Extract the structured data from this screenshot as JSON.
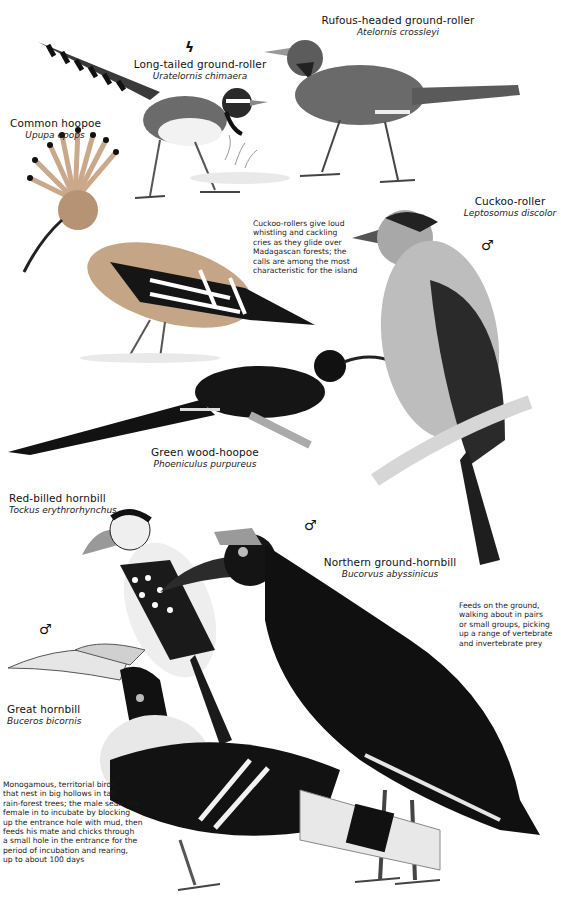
{
  "plate": {
    "species": [
      {
        "id": "long-tailed-ground-roller",
        "common": "Long-tailed ground-roller",
        "scientific": "Uratelornis chimaera",
        "symbol": "endangered-lightning-icon"
      },
      {
        "id": "rufous-headed-ground-roller",
        "common": "Rufous-headed ground-roller",
        "scientific": "Atelornis crossleyi"
      },
      {
        "id": "common-hoopoe",
        "common": "Common hoopoe",
        "scientific": "Upupa epops"
      },
      {
        "id": "cuckoo-roller",
        "common": "Cuckoo-roller",
        "scientific": "Leptosomus discolor",
        "sex": "♂"
      },
      {
        "id": "green-wood-hoopoe",
        "common": "Green wood-hoopoe",
        "scientific": "Phoeniculus purpureus"
      },
      {
        "id": "red-billed-hornbill",
        "common": "Red-billed hornbill",
        "scientific": "Tockus erythrorhynchus"
      },
      {
        "id": "northern-ground-hornbill",
        "common": "Northern ground-hornbill",
        "scientific": "Bucorvus abyssinicus",
        "sex": "♂"
      },
      {
        "id": "great-hornbill",
        "common": "Great hornbill",
        "scientific": "Buceros bicornis",
        "sex": "♂"
      }
    ],
    "notes": {
      "cuckoo_roller": "Cuckoo-rollers give loud\nwhistling and cackling\ncries as they glide over\nMadagascan forests; the\ncalls are among the most\ncharacteristic for the island",
      "ground_hornbill": "Feeds on the ground,\nwalking about in pairs\nor small groups, picking\nup a range of vertebrate\nand invertebrate prey",
      "great_hornbill": "Monogamous, territorial birds\nthat nest in big hollows in tall\nrain-forest trees; the male seals the\nfemale in to incubate by blocking\nup the entrance hole with mud, then\nfeeds his mate and chicks through\na small hole in the entrance for the\nperiod of incubation and rearing,\nup to about 100 days"
    },
    "symbols": {
      "endangered": "ϟ"
    }
  }
}
